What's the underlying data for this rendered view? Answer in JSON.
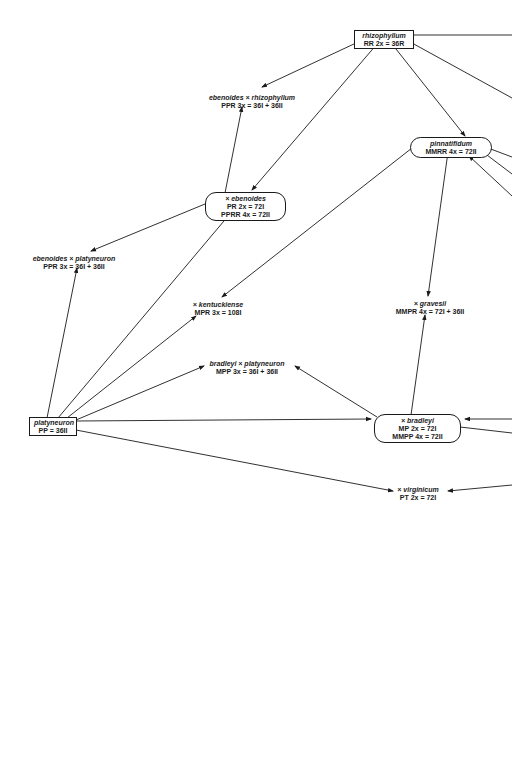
{
  "diagram": {
    "type": "hybridization-network",
    "nodes": {
      "rhizophyllum": {
        "name": "rhizophyllum",
        "line1": "RR   2x = 36R",
        "shape": "box"
      },
      "ebenoides_x_rhizophyllum": {
        "name": "ebenoides × rhizophyllum",
        "line1": "PPR   3x = 36I + 36II",
        "shape": "plain"
      },
      "pinnatifidum": {
        "name": "pinnatifidum",
        "line1": "MMRR   4x = 72II",
        "shape": "pill"
      },
      "x_ebenoides": {
        "name": "× ebenoides",
        "line1": "PR   2x = 72I",
        "line2": "PPRR   4x = 72II",
        "shape": "pill"
      },
      "ebenoides_x_platyneuron": {
        "name": "ebenoides × platyneuron",
        "line1": "PPR   3x = 36I + 36II",
        "shape": "plain"
      },
      "x_kentuckiense": {
        "name": "× kentuckiense",
        "line1": "MPR   3x = 108I",
        "shape": "plain"
      },
      "x_gravesii": {
        "name": "× gravesii",
        "line1": "MMPR   4x = 72I + 36II",
        "shape": "plain"
      },
      "bradleyi_x_platyneuron": {
        "name": "bradleyi × platyneuron",
        "line1": "MPP   3x = 36I + 36II",
        "shape": "plain"
      },
      "platyneuron": {
        "name": "platyneuron",
        "line1": "PP = 36II",
        "shape": "box"
      },
      "x_bradleyi": {
        "name": "× bradleyi",
        "line1": "MP   2x = 72I",
        "line2": "MMPP   4x = 72II",
        "shape": "pill"
      },
      "x_virginicum": {
        "name": "× virginicum",
        "line1": "PT   2x = 72I",
        "shape": "plain"
      }
    },
    "edges": [
      [
        "rhizophyllum",
        "ebenoides_x_rhizophyllum"
      ],
      [
        "rhizophyllum",
        "x_ebenoides"
      ],
      [
        "rhizophyllum",
        "pinnatifidum"
      ],
      [
        "x_ebenoides",
        "ebenoides_x_rhizophyllum"
      ],
      [
        "x_ebenoides",
        "ebenoides_x_platyneuron"
      ],
      [
        "pinnatifidum",
        "x_kentuckiense"
      ],
      [
        "pinnatifidum",
        "x_gravesii"
      ],
      [
        "platyneuron",
        "ebenoides_x_platyneuron"
      ],
      [
        "platyneuron",
        "x_ebenoides"
      ],
      [
        "platyneuron",
        "x_kentuckiense"
      ],
      [
        "platyneuron",
        "bradleyi_x_platyneuron"
      ],
      [
        "platyneuron",
        "x_bradleyi"
      ],
      [
        "platyneuron",
        "x_virginicum"
      ],
      [
        "x_bradleyi",
        "bradleyi_x_platyneuron"
      ],
      [
        "x_bradleyi",
        "x_gravesii"
      ]
    ],
    "line_color": "#1a1a1a"
  }
}
